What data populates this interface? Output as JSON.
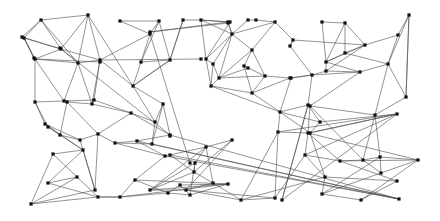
{
  "figure": {
    "type": "node-link-graph",
    "title": "",
    "background_color": "#ffffff",
    "edge_color": "#4a4a4a",
    "edge_width": 0.6,
    "node_color": "#111111",
    "node_shape": "square",
    "node_size": 3.2,
    "width": 440,
    "height": 221
  },
  "chart_data": {
    "type": "scatter",
    "title": "",
    "xlabel": "",
    "ylabel": "",
    "xlim": [
      0,
      440
    ],
    "ylim": [
      0,
      221
    ],
    "grid": false,
    "legend": null,
    "node_count": 116,
    "edge_count": 218,
    "nodes": [
      [
        41,
        20
      ],
      [
        88,
        15
      ],
      [
        24,
        38
      ],
      [
        61,
        49
      ],
      [
        35,
        59
      ],
      [
        78,
        63
      ],
      [
        100,
        60
      ],
      [
        120,
        21
      ],
      [
        159,
        21
      ],
      [
        150,
        34
      ],
      [
        141,
        62
      ],
      [
        170,
        60
      ],
      [
        133,
        86
      ],
      [
        183,
        20
      ],
      [
        201,
        20
      ],
      [
        228,
        22
      ],
      [
        248,
        20
      ],
      [
        256,
        20
      ],
      [
        275,
        22
      ],
      [
        232,
        34
      ],
      [
        252,
        50
      ],
      [
        206,
        59
      ],
      [
        213,
        64
      ],
      [
        244,
        66
      ],
      [
        248,
        68
      ],
      [
        219,
        78
      ],
      [
        211,
        86
      ],
      [
        265,
        76
      ],
      [
        252,
        93
      ],
      [
        290,
        46
      ],
      [
        291,
        78
      ],
      [
        293,
        40
      ],
      [
        322,
        22
      ],
      [
        345,
        23
      ],
      [
        409,
        15
      ],
      [
        398,
        35
      ],
      [
        365,
        45
      ],
      [
        345,
        53
      ],
      [
        326,
        62
      ],
      [
        388,
        64
      ],
      [
        326,
        71
      ],
      [
        360,
        72
      ],
      [
        406,
        97
      ],
      [
        290,
        78
      ],
      [
        312,
        75
      ],
      [
        308,
        105
      ],
      [
        280,
        112
      ],
      [
        320,
        122
      ],
      [
        278,
        132
      ],
      [
        310,
        133
      ],
      [
        35,
        102
      ],
      [
        64,
        101
      ],
      [
        94,
        100
      ],
      [
        45,
        124
      ],
      [
        80,
        140
      ],
      [
        98,
        134
      ],
      [
        67,
        102
      ],
      [
        48,
        127
      ],
      [
        60,
        135
      ],
      [
        92,
        104
      ],
      [
        131,
        113
      ],
      [
        155,
        122
      ],
      [
        163,
        104
      ],
      [
        152,
        144
      ],
      [
        170,
        135
      ],
      [
        115,
        143
      ],
      [
        137,
        141
      ],
      [
        165,
        156
      ],
      [
        135,
        180
      ],
      [
        120,
        197
      ],
      [
        168,
        193
      ],
      [
        190,
        195
      ],
      [
        180,
        185
      ],
      [
        53,
        154
      ],
      [
        83,
        150
      ],
      [
        48,
        183
      ],
      [
        77,
        177
      ],
      [
        31,
        204
      ],
      [
        95,
        190
      ],
      [
        98,
        197
      ],
      [
        232,
        140
      ],
      [
        206,
        147
      ],
      [
        195,
        163
      ],
      [
        194,
        172
      ],
      [
        213,
        183
      ],
      [
        228,
        184
      ],
      [
        150,
        190
      ],
      [
        186,
        190
      ],
      [
        241,
        200
      ],
      [
        275,
        198
      ],
      [
        282,
        200
      ],
      [
        310,
        106
      ],
      [
        375,
        115
      ],
      [
        397,
        114
      ],
      [
        308,
        133
      ],
      [
        305,
        155
      ],
      [
        340,
        161
      ],
      [
        363,
        160
      ],
      [
        380,
        157
      ],
      [
        418,
        160
      ],
      [
        381,
        173
      ],
      [
        397,
        181
      ],
      [
        325,
        177
      ],
      [
        322,
        194
      ],
      [
        361,
        200
      ],
      [
        399,
        199
      ],
      [
        170,
        155
      ],
      [
        190,
        163
      ],
      [
        150,
        32
      ],
      [
        228,
        23
      ],
      [
        230,
        22
      ],
      [
        201,
        59
      ],
      [
        100,
        62
      ],
      [
        34,
        58
      ],
      [
        22,
        37
      ],
      [
        60,
        48
      ],
      [
        170,
        136
      ]
    ],
    "edges": [
      [
        0,
        1
      ],
      [
        0,
        2
      ],
      [
        0,
        3
      ],
      [
        0,
        5
      ],
      [
        1,
        3
      ],
      [
        1,
        6
      ],
      [
        1,
        5
      ],
      [
        2,
        3
      ],
      [
        2,
        4
      ],
      [
        3,
        4
      ],
      [
        3,
        5
      ],
      [
        3,
        6
      ],
      [
        4,
        5
      ],
      [
        4,
        50
      ],
      [
        4,
        51
      ],
      [
        5,
        6
      ],
      [
        5,
        51
      ],
      [
        5,
        59
      ],
      [
        6,
        12
      ],
      [
        6,
        52
      ],
      [
        6,
        59
      ],
      [
        1,
        12
      ],
      [
        7,
        8
      ],
      [
        7,
        9
      ],
      [
        8,
        9
      ],
      [
        8,
        10
      ],
      [
        8,
        11
      ],
      [
        9,
        10
      ],
      [
        9,
        6
      ],
      [
        10,
        11
      ],
      [
        10,
        12
      ],
      [
        11,
        12
      ],
      [
        11,
        13
      ],
      [
        12,
        61
      ],
      [
        12,
        62
      ],
      [
        13,
        14
      ],
      [
        13,
        11
      ],
      [
        14,
        15
      ],
      [
        14,
        19
      ],
      [
        14,
        21
      ],
      [
        15,
        19
      ],
      [
        16,
        17
      ],
      [
        16,
        19
      ],
      [
        17,
        18
      ],
      [
        18,
        19
      ],
      [
        18,
        20
      ],
      [
        19,
        20
      ],
      [
        19,
        21
      ],
      [
        19,
        22
      ],
      [
        19,
        25
      ],
      [
        20,
        23
      ],
      [
        20,
        25
      ],
      [
        21,
        22
      ],
      [
        21,
        26
      ],
      [
        22,
        25
      ],
      [
        22,
        26
      ],
      [
        23,
        24
      ],
      [
        23,
        27
      ],
      [
        24,
        25
      ],
      [
        25,
        26
      ],
      [
        25,
        27
      ],
      [
        26,
        28
      ],
      [
        27,
        28
      ],
      [
        27,
        43
      ],
      [
        28,
        46
      ],
      [
        29,
        31
      ],
      [
        29,
        44
      ],
      [
        30,
        43
      ],
      [
        30,
        46
      ],
      [
        31,
        18
      ],
      [
        31,
        36
      ],
      [
        32,
        33
      ],
      [
        32,
        38
      ],
      [
        33,
        36
      ],
      [
        33,
        37
      ],
      [
        34,
        35
      ],
      [
        34,
        39
      ],
      [
        34,
        42
      ],
      [
        35,
        36
      ],
      [
        35,
        39
      ],
      [
        36,
        37
      ],
      [
        36,
        38
      ],
      [
        37,
        38
      ],
      [
        37,
        39
      ],
      [
        38,
        40
      ],
      [
        38,
        41
      ],
      [
        39,
        41
      ],
      [
        39,
        42
      ],
      [
        40,
        41
      ],
      [
        40,
        44
      ],
      [
        41,
        44
      ],
      [
        41,
        91
      ],
      [
        42,
        92
      ],
      [
        43,
        44
      ],
      [
        43,
        30
      ],
      [
        44,
        45
      ],
      [
        45,
        46
      ],
      [
        45,
        47
      ],
      [
        45,
        90
      ],
      [
        46,
        48
      ],
      [
        46,
        47
      ],
      [
        47,
        49
      ],
      [
        48,
        49
      ],
      [
        48,
        93
      ],
      [
        49,
        93
      ],
      [
        50,
        51
      ],
      [
        50,
        53
      ],
      [
        50,
        57
      ],
      [
        51,
        52
      ],
      [
        51,
        56
      ],
      [
        52,
        59
      ],
      [
        53,
        54
      ],
      [
        53,
        57
      ],
      [
        53,
        74
      ],
      [
        54,
        55
      ],
      [
        54,
        58
      ],
      [
        54,
        78
      ],
      [
        55,
        65
      ],
      [
        55,
        60
      ],
      [
        56,
        58
      ],
      [
        56,
        59
      ],
      [
        57,
        58
      ],
      [
        58,
        74
      ],
      [
        59,
        60
      ],
      [
        60,
        61
      ],
      [
        60,
        64
      ],
      [
        61,
        62
      ],
      [
        61,
        63
      ],
      [
        62,
        63
      ],
      [
        62,
        64
      ],
      [
        63,
        65
      ],
      [
        64,
        66
      ],
      [
        64,
        105
      ],
      [
        65,
        66
      ],
      [
        65,
        67
      ],
      [
        66,
        67
      ],
      [
        67,
        68
      ],
      [
        67,
        81
      ],
      [
        68,
        69
      ],
      [
        68,
        70
      ],
      [
        68,
        85
      ],
      [
        69,
        70
      ],
      [
        70,
        71
      ],
      [
        70,
        72
      ],
      [
        71,
        72
      ],
      [
        71,
        82
      ],
      [
        73,
        74
      ],
      [
        73,
        76
      ],
      [
        73,
        77
      ],
      [
        74,
        75
      ],
      [
        74,
        78
      ],
      [
        75,
        76
      ],
      [
        75,
        79
      ],
      [
        76,
        77
      ],
      [
        76,
        79
      ],
      [
        77,
        79
      ],
      [
        78,
        55
      ],
      [
        79,
        69
      ],
      [
        80,
        81
      ],
      [
        80,
        83
      ],
      [
        80,
        87
      ],
      [
        81,
        82
      ],
      [
        81,
        84
      ],
      [
        82,
        83
      ],
      [
        82,
        86
      ],
      [
        83,
        84
      ],
      [
        83,
        86
      ],
      [
        84,
        87
      ],
      [
        85,
        69
      ],
      [
        85,
        86
      ],
      [
        86,
        87
      ],
      [
        87,
        88
      ],
      [
        88,
        48
      ],
      [
        88,
        89
      ],
      [
        89,
        48
      ],
      [
        90,
        45
      ],
      [
        90,
        93
      ],
      [
        91,
        92
      ],
      [
        91,
        97
      ],
      [
        91,
        94
      ],
      [
        92,
        97
      ],
      [
        92,
        98
      ],
      [
        93,
        94
      ],
      [
        93,
        95
      ],
      [
        94,
        95
      ],
      [
        94,
        96
      ],
      [
        95,
        96
      ],
      [
        95,
        102
      ],
      [
        96,
        97
      ],
      [
        96,
        99
      ],
      [
        97,
        98
      ],
      [
        97,
        100
      ],
      [
        98,
        99
      ],
      [
        98,
        100
      ],
      [
        99,
        100
      ],
      [
        99,
        104
      ],
      [
        100,
        103
      ],
      [
        101,
        102
      ],
      [
        101,
        104
      ],
      [
        102,
        103
      ],
      [
        103,
        104
      ],
      [
        88,
        102
      ],
      [
        89,
        95
      ],
      [
        49,
        102
      ],
      [
        46,
        49
      ],
      [
        47,
        93
      ],
      [
        29,
        31
      ],
      [
        30,
        44
      ],
      [
        33,
        38
      ],
      [
        36,
        40
      ],
      [
        39,
        92
      ],
      [
        42,
        34
      ],
      [
        63,
        105
      ],
      [
        105,
        106
      ],
      [
        106,
        83
      ],
      [
        105,
        67
      ],
      [
        9,
        107
      ],
      [
        15,
        108
      ],
      [
        108,
        109
      ],
      [
        109,
        19
      ],
      [
        14,
        110
      ],
      [
        110,
        21
      ],
      [
        111,
        6
      ],
      [
        112,
        4
      ],
      [
        113,
        2
      ],
      [
        114,
        3
      ],
      [
        115,
        64
      ],
      [
        0,
        114
      ],
      [
        2,
        113
      ],
      [
        12,
        11
      ],
      [
        20,
        27
      ],
      [
        23,
        28
      ],
      [
        26,
        46
      ],
      [
        43,
        28
      ],
      [
        52,
        60
      ],
      [
        55,
        56
      ],
      [
        66,
        105
      ],
      [
        72,
        85
      ],
      [
        81,
        86
      ],
      [
        84,
        88
      ],
      [
        96,
        101
      ],
      [
        94,
        99
      ],
      [
        53,
        58
      ],
      [
        77,
        78
      ],
      [
        69,
        79
      ],
      [
        71,
        85
      ],
      [
        87,
        89
      ],
      [
        98,
        103
      ]
    ]
  }
}
